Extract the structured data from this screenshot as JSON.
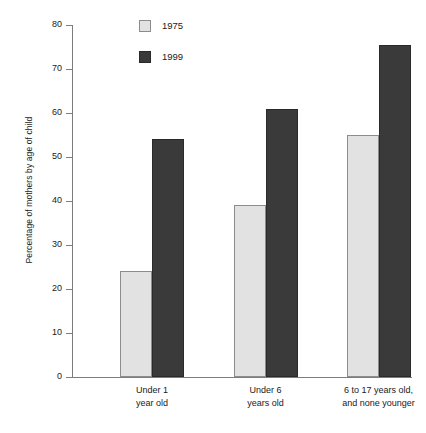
{
  "chart_data": {
    "type": "bar",
    "title": "",
    "xlabel": "",
    "ylabel": "Percentage of mothers by age of child",
    "ylim": [
      0,
      80
    ],
    "ytick_values": [
      0,
      10,
      20,
      30,
      40,
      50,
      60,
      70,
      80
    ],
    "ytick_labels": [
      "0",
      "10",
      "20",
      "30",
      "40",
      "50",
      "60",
      "70",
      "80"
    ],
    "grid": false,
    "legend_position": "top-center",
    "categories": [
      "Under 1\nyear old",
      "Under 6\nyears old",
      "6 to 17 years old,\nand none younger"
    ],
    "category_lines": [
      [
        "Under 1",
        "year old"
      ],
      [
        "Under 6",
        "years old"
      ],
      [
        "6 to 17 years old,",
        "and none younger"
      ]
    ],
    "series": [
      {
        "name": "1975",
        "color": "#e2e2e2",
        "border_color": "#8c8c8c",
        "values": [
          24,
          39,
          55
        ]
      },
      {
        "name": "1999",
        "color": "#3a3a3a",
        "border_color": "#2a2a2a",
        "values": [
          54,
          61,
          75.5
        ]
      }
    ]
  },
  "legend": {
    "items": [
      {
        "label": "1975"
      },
      {
        "label": "1999"
      }
    ]
  }
}
